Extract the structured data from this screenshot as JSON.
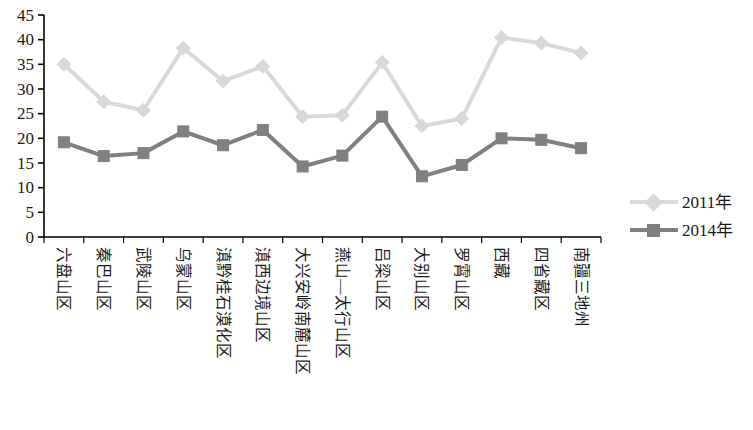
{
  "chart_data": {
    "type": "line",
    "title": "",
    "xlabel": "",
    "ylabel": "",
    "ylim": [
      0,
      45
    ],
    "ytick_step": 5,
    "yticks": [
      "45",
      "40",
      "35",
      "30",
      "25",
      "20",
      "15",
      "10",
      "5",
      "0"
    ],
    "grid": false,
    "legend_position": "right",
    "categories": [
      "六盘山区",
      "秦巴山区",
      "武陵山区",
      "乌蒙山区",
      "滇黔桂石漠化区",
      "滇西边境山区",
      "大兴安岭南麓山区",
      "燕山—太行山区",
      "吕梁山区",
      "大别山区",
      "罗霄山区",
      "西藏",
      "四省藏区",
      "南疆三地州"
    ],
    "series": [
      {
        "name": "2011年",
        "color": "#d9d9d9",
        "marker": "diamond",
        "values": [
          35.0,
          27.4,
          25.7,
          38.3,
          31.6,
          34.6,
          24.4,
          24.7,
          35.4,
          22.5,
          24.0,
          40.4,
          39.3,
          37.3
        ]
      },
      {
        "name": "2014年",
        "color": "#808080",
        "marker": "square",
        "values": [
          19.2,
          16.4,
          17.0,
          21.4,
          18.6,
          21.7,
          14.3,
          16.5,
          24.4,
          12.3,
          14.6,
          20.0,
          19.7,
          18.0
        ]
      }
    ]
  },
  "legend": {
    "entries": [
      {
        "label": "2011年"
      },
      {
        "label": "2014年"
      }
    ]
  },
  "axis": {
    "line_color": "#000000"
  }
}
